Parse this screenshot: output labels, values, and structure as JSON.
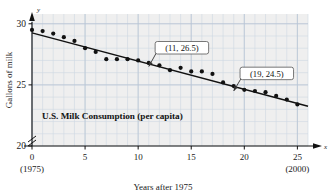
{
  "chart_data": {
    "type": "scatter",
    "title": "U.S. Milk Consumption (per capita)",
    "xlabel": "Years after 1975",
    "ylabel": "Gallons of milk",
    "xlim": [
      0,
      26
    ],
    "ylim": [
      20,
      30.8
    ],
    "grid": true,
    "axis_break_y": true,
    "legend": "none",
    "xticks": [
      0,
      5,
      10,
      15,
      20,
      25
    ],
    "xticklabels": [
      "0",
      "5",
      "10",
      "15",
      "20",
      "25"
    ],
    "xtick_sublabels": {
      "0": "(1975)",
      "25": "(2000)"
    },
    "yticks": [
      20,
      25,
      30
    ],
    "yticklabels": [
      "20",
      "25",
      "30"
    ],
    "x": [
      0,
      1,
      2,
      3,
      4,
      5,
      6,
      7,
      8,
      9,
      10,
      11,
      12,
      13,
      14,
      15,
      16,
      17,
      18,
      19,
      20,
      21,
      22,
      23,
      24,
      25
    ],
    "y": [
      29.5,
      29.4,
      29.2,
      28.9,
      28.6,
      28.0,
      27.7,
      27.1,
      27.1,
      27.1,
      27.0,
      26.8,
      26.6,
      26.2,
      26.4,
      26.1,
      26.1,
      25.9,
      25.2,
      24.9,
      24.6,
      24.5,
      24.4,
      24.1,
      23.8,
      23.4
    ],
    "series": [
      {
        "name": "U.S. milk consumption (gallons per capita)",
        "type": "scatter",
        "values": [
          29.5,
          29.4,
          29.2,
          28.9,
          28.6,
          28.0,
          27.7,
          27.1,
          27.1,
          27.1,
          27.0,
          26.8,
          26.6,
          26.2,
          26.4,
          26.1,
          26.1,
          25.9,
          25.2,
          24.9,
          24.6,
          24.5,
          24.4,
          24.1,
          23.8,
          23.4
        ]
      },
      {
        "name": "trend line",
        "type": "line",
        "endpoints": [
          [
            0,
            29.25
          ],
          [
            26,
            23.25
          ]
        ],
        "slope": -0.25,
        "intercept": 29.25
      }
    ],
    "annotations": [
      {
        "label": "(11, 26.5)",
        "point": [
          11,
          26.5
        ],
        "box_x": 11.6,
        "box_y": 28.55
      },
      {
        "label": "(19, 24.5)",
        "point": [
          19,
          24.5
        ],
        "box_x": 19.6,
        "box_y": 26.45
      }
    ],
    "colors": {
      "point": "#111111",
      "line": "#111111",
      "grid_minor": "#cfd8e3",
      "grid_major": "#b8c4d4",
      "plot_bg": "#efefef",
      "axis": "#111111",
      "text": "#1a1a1a",
      "callout_bg": "#ffffff",
      "callout_border": "#555555"
    }
  },
  "axes": {
    "y_axis_symbol": "y",
    "x_axis_symbol": "x"
  }
}
